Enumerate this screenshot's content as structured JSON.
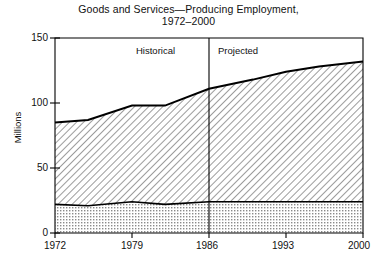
{
  "chart_data": {
    "type": "area",
    "title": "Goods and Services—Producing Employment,",
    "subtitle": "1972–2000",
    "xlabel": "",
    "ylabel": "Millions",
    "xlim": [
      1972,
      2000
    ],
    "ylim": [
      0,
      150
    ],
    "xticks": [
      1972,
      1979,
      1986,
      1993,
      2000
    ],
    "yticks": [
      0,
      50,
      100,
      150
    ],
    "grid": false,
    "legend_position": "inline-annotations",
    "stacked": true,
    "x": [
      1972,
      1975,
      1979,
      1982,
      1986,
      1990,
      1993,
      1996,
      2000
    ],
    "series": [
      {
        "name": "Goods",
        "fill": "stipple-dots",
        "values": [
          22,
          21,
          24,
          22,
          24,
          24,
          24,
          24,
          24
        ]
      },
      {
        "name": "Services",
        "fill": "diagonal-hatch",
        "values": [
          63,
          66,
          74,
          76,
          87,
          94,
          100,
          104,
          108
        ]
      }
    ],
    "total": {
      "name": "Total employment",
      "values": [
        85,
        87,
        98,
        98,
        111,
        118,
        124,
        128,
        132
      ]
    },
    "annotations": [
      {
        "text": "Historical",
        "x": 1979.5,
        "y": 140
      },
      {
        "text": "Projected",
        "x": 1992.0,
        "y": 140
      },
      {
        "text": "Services",
        "x": 1974.0,
        "y": 62
      },
      {
        "text": "Goods",
        "x": 1974.0,
        "y": 13
      }
    ],
    "divider": {
      "x": 1986,
      "label": "historical-projected-divider"
    }
  },
  "axis": {
    "y_tick_labels": [
      "150",
      "100",
      "50",
      "0"
    ],
    "x_tick_labels": [
      "1972",
      "1979",
      "1986",
      "1993",
      "2000"
    ],
    "y_axis_title": "Millions"
  },
  "regions": {
    "historical": "Historical",
    "projected": "Projected"
  },
  "series_labels": {
    "services": "Services",
    "goods": "Goods"
  },
  "colors": {
    "axis": "#000000",
    "plot_background": "#ffffff",
    "page_background": "#ffffff",
    "line": "#000000",
    "hatch": "#555555",
    "stipple": "#777777"
  }
}
